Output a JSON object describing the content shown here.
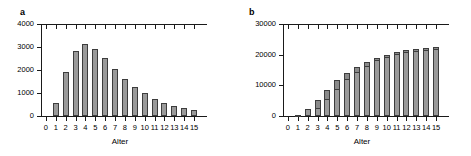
{
  "figure": {
    "background": "#ffffff",
    "bar_fill": "#9a9a9a",
    "bar_stroke": "#3d3d3d",
    "axis_color": "#1a1a1a"
  },
  "panels": [
    {
      "key": "a",
      "letter": "a",
      "chart_data": {
        "type": "bar",
        "title": "a",
        "xlabel": "Alter",
        "ylabel": "",
        "categories": [
          "0",
          "1",
          "2",
          "3",
          "4",
          "5",
          "6",
          "7",
          "8",
          "9",
          "10",
          "11",
          "12",
          "13",
          "14",
          "15"
        ],
        "values": [
          0,
          560,
          1930,
          2840,
          3130,
          2930,
          2520,
          2060,
          1630,
          1260,
          980,
          740,
          570,
          440,
          340,
          280
        ],
        "ylim": [
          0,
          4000
        ],
        "yticks": [
          0,
          1000,
          2000,
          3000,
          4000
        ],
        "ytick_labels": [
          "0",
          "1000",
          "2000",
          "3000",
          "4000"
        ],
        "grid": false,
        "legend": "none",
        "top_axis": true
      }
    },
    {
      "key": "b",
      "letter": "b",
      "chart_data": {
        "type": "bar",
        "title": "b",
        "xlabel": "Alter",
        "ylabel": "",
        "categories": [
          "0",
          "1",
          "2",
          "3",
          "4",
          "5",
          "6",
          "7",
          "8",
          "9",
          "10",
          "11",
          "12",
          "13",
          "14",
          "15"
        ],
        "stacked": true,
        "series": [
          {
            "name": "lower",
            "values": [
              0,
              300,
              1900,
              2500,
              5500,
              8800,
              11900,
              14500,
              16400,
              18100,
              19100,
              20200,
              20900,
              21200,
              21500,
              21700
            ]
          },
          {
            "name": "upper",
            "values": [
              0,
              120,
              350,
              2600,
              3100,
              2800,
              2000,
              1500,
              1300,
              900,
              900,
              800,
              700,
              800,
              800,
              800
            ]
          }
        ],
        "values": [
          0,
          420,
          2250,
          5100,
          8600,
          11600,
          13900,
          16000,
          17700,
          19000,
          20000,
          21000,
          21600,
          22000,
          22300,
          22500
        ],
        "ylim": [
          0,
          30000
        ],
        "yticks": [
          0,
          10000,
          20000,
          30000
        ],
        "ytick_labels": [
          "0",
          "10000",
          "20000",
          "30000"
        ],
        "grid": false,
        "legend": "none",
        "top_axis": true
      }
    }
  ]
}
